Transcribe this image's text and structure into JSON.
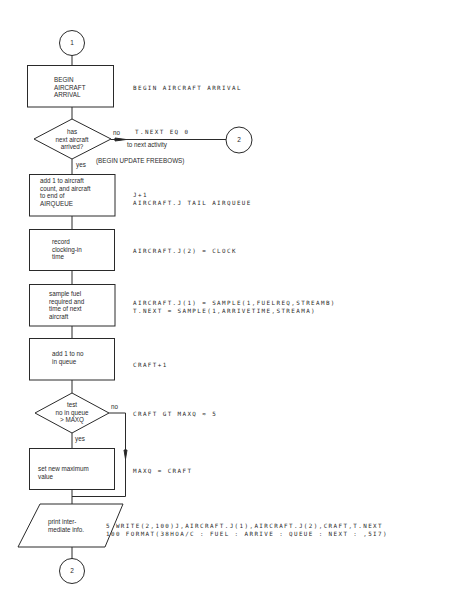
{
  "connectors": {
    "start": "1",
    "exit_right": "2",
    "end": "2"
  },
  "nodes": {
    "begin": "BEGIN\nAIRCRAFT\nARRIVAL",
    "decision_arrived": "has\nnext aircraft\narrived?",
    "add_aircraft": "add 1 to aircraft\ncount, and aircraft\nto end of\nAIRQUEUE",
    "record_clock": "record\nclocking-in\ntime",
    "sample_fuel": "sample fuel\nrequired and\ntime of next\naircraft",
    "add_queue": "add 1 to no\nin queue",
    "decision_maxq": "test\nno in queue\n> MAXQ",
    "set_max": "set new maximum\nvalue",
    "print_info": "print inter-\nmediate info."
  },
  "edge_labels": {
    "arrived_no": "no",
    "arrived_yes": "yes",
    "to_next_activity": "to next activity",
    "begin_update": "(BEGIN UPDATE FREEBOWS)",
    "maxq_no": "no",
    "maxq_yes": "yes"
  },
  "code": {
    "begin": "BEGIN AIRCRAFT ARRIVAL",
    "t_next_eq": "T.NEXT EQ 0",
    "add_aircraft": "J+1\nAIRCRAFT.J TAIL AIRQUEUE",
    "record_clock": "AIRCRAFT.J(2) = CLOCK",
    "sample_fuel": "AIRCRAFT.J(1) = SAMPLE(1,FUELREQ,STREAMB)\nT.NEXT = SAMPLE(1,ARRIVETIME,STREAMA)",
    "add_queue": "CRAFT+1",
    "test_maxq": "CRAFT GT MAXQ ≈ 5",
    "set_max": "MAXQ = CRAFT",
    "print_info": "5 WRITE(2,100)J,AIRCRAFT.J(1),AIRCRAFT.J(2),CRAFT,T.NEXT\n100 FORMAT(38HOA/C : FUEL : ARRIVE : QUEUE : NEXT : ,5I7)"
  }
}
